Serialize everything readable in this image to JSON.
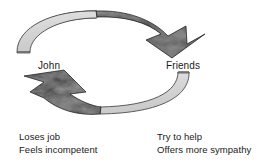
{
  "diagram": {
    "type": "cycle-diagram",
    "background_color": "#ffffff",
    "nodes": [
      {
        "id": "john",
        "label": "John",
        "position": "left",
        "caption_lines": [
          "Loses job",
          "Feels incompetent"
        ]
      },
      {
        "id": "friends",
        "label": "Friends",
        "position": "right",
        "caption_lines": [
          "Try to help",
          "Offers more sympathy"
        ]
      }
    ],
    "arrows": [
      {
        "id": "john-to-friends",
        "from": "john",
        "to": "friends",
        "path": "top",
        "direction": "clockwise",
        "tail_style": "light-gray-band",
        "head_style": "dark-textured-chevron",
        "tail_color": "#d2d2d2",
        "head_color": "#1c1c1c",
        "outline_color": "#4a4a4a"
      },
      {
        "id": "friends-to-john",
        "from": "friends",
        "to": "john",
        "path": "bottom",
        "direction": "clockwise",
        "tail_style": "light-gray-band",
        "head_style": "dark-textured-chevron",
        "tail_color": "#d2d2d2",
        "head_color": "#1c1c1c",
        "outline_color": "#4a4a4a"
      }
    ],
    "colors": {
      "light_fill": "#d2d2d2",
      "light_fill_highlight": "#e2e2e2",
      "dark_fill": "#1c1c1c",
      "dark_fill_mid": "#4d4d4d",
      "dark_fill_light": "#7a7a7a",
      "outline": "#4a4a4a",
      "text": "#1a1a1a",
      "background": "#ffffff"
    }
  }
}
